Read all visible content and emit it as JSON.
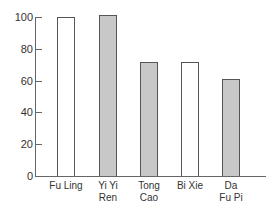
{
  "chart_data": {
    "type": "bar",
    "title": "",
    "xlabel": "",
    "ylabel": "",
    "categories": [
      "Fu Ling",
      "Yi Yi Ren",
      "Tong Cao",
      "Bi Xie",
      "Da Fu Pi"
    ],
    "category_labels": [
      [
        "Fu Ling"
      ],
      [
        "Yi Yi",
        "Ren"
      ],
      [
        "Tong",
        "Cao"
      ],
      [
        "Bi Xie"
      ],
      [
        "Da",
        "Fu Pi"
      ]
    ],
    "values": [
      100,
      101,
      72,
      72,
      61
    ],
    "bar_styles": [
      "white",
      "gray",
      "gray",
      "white",
      "gray"
    ],
    "ylim": [
      0,
      100
    ],
    "yticks": [
      0,
      20,
      40,
      60,
      80,
      100
    ],
    "grid": false,
    "legend": null,
    "colors": {
      "white_fill": "#ffffff",
      "gray_fill": "#c8c8c8",
      "border": "#555555"
    }
  }
}
